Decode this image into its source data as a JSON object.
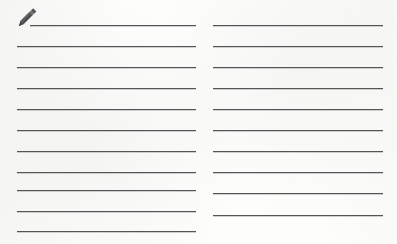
{
  "document": {
    "kind": "ruled-note-sheet",
    "background_color": "#fdfdfc",
    "rule_color": "#555557",
    "rule_thickness_px": 1.4,
    "columns": 2,
    "icon": {
      "name": "pencil-icon",
      "label": "Pencil",
      "color": "#4e4e52",
      "x": 17,
      "y": 7,
      "width": 21,
      "height": 20
    },
    "left_column": {
      "label": "Left ruled column",
      "x": 17,
      "width": 179,
      "line_count": 11,
      "lines": [
        {
          "y": 25,
          "x": 30,
          "width": 166,
          "note": "first line, inset for pencil"
        },
        {
          "y": 46,
          "x": 17,
          "width": 179
        },
        {
          "y": 67,
          "x": 17,
          "width": 179
        },
        {
          "y": 88,
          "x": 17,
          "width": 179
        },
        {
          "y": 109,
          "x": 17,
          "width": 179
        },
        {
          "y": 130,
          "x": 17,
          "width": 179
        },
        {
          "y": 151,
          "x": 17,
          "width": 179
        },
        {
          "y": 172,
          "x": 17,
          "width": 179
        },
        {
          "y": 190,
          "x": 17,
          "width": 179
        },
        {
          "y": 211,
          "x": 17,
          "width": 179
        },
        {
          "y": 231,
          "x": 17,
          "width": 179
        }
      ]
    },
    "right_column": {
      "label": "Right ruled column",
      "x": 213,
      "width": 170,
      "line_count": 10,
      "lines": [
        {
          "y": 25,
          "x": 213,
          "width": 170
        },
        {
          "y": 46,
          "x": 213,
          "width": 170
        },
        {
          "y": 67,
          "x": 213,
          "width": 170
        },
        {
          "y": 88,
          "x": 213,
          "width": 170
        },
        {
          "y": 109,
          "x": 213,
          "width": 170
        },
        {
          "y": 130,
          "x": 213,
          "width": 170
        },
        {
          "y": 151,
          "x": 213,
          "width": 170
        },
        {
          "y": 172,
          "x": 213,
          "width": 170
        },
        {
          "y": 193,
          "x": 213,
          "width": 170
        },
        {
          "y": 215,
          "x": 213,
          "width": 170
        }
      ]
    }
  }
}
